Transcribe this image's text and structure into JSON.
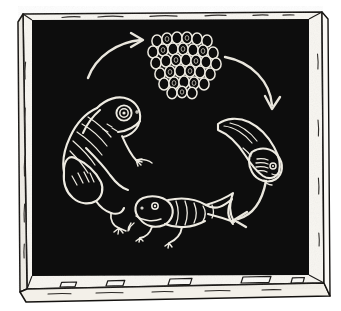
{
  "illustration": {
    "title": "Frog Life Cycle Chalkboard Diagram",
    "medium": "chalk drawing on blackboard",
    "board_color": "#0d0c0b",
    "chalk_color": "#f2f0ea",
    "frame_color": "#f7f5f0",
    "frame_line_color": "#14120f",
    "outer_background": "#ffffff",
    "board_rect": {
      "x": 30,
      "y": 18,
      "width": 278,
      "height": 258
    },
    "frame_outer": {
      "x": 18,
      "y": 8,
      "width": 306,
      "height": 284
    },
    "cycle_direction": "clockwise"
  },
  "stages": [
    {
      "id": "eggs",
      "name": "frog-eggs",
      "label": "Frog eggs (spawn)",
      "order": 1,
      "center": {
        "x": 184,
        "y": 62
      },
      "egg_count": 40,
      "egg_rows": [
        6,
        7,
        7,
        7,
        7,
        4,
        2
      ],
      "description": "Cluster of oval eggs, white chalk outlines with dark centers"
    },
    {
      "id": "tadpole",
      "name": "tadpole",
      "label": "Tadpole",
      "order": 2,
      "center": {
        "x": 254,
        "y": 148
      },
      "description": "Tadpole with external gills, head lower-right, tail sweeping upper-left"
    },
    {
      "id": "froglet",
      "name": "froglet",
      "label": "Froglet (tadpole with legs)",
      "order": 3,
      "center": {
        "x": 174,
        "y": 228
      },
      "description": "Tadpole that has grown hind and front legs, tail still present, facing left"
    },
    {
      "id": "adult-frog",
      "name": "adult-frog",
      "label": "Adult frog",
      "order": 4,
      "center": {
        "x": 92,
        "y": 140
      },
      "description": "Adult frog in profile facing right, large round eye, folded hind leg"
    }
  ],
  "arrows": [
    {
      "id": "arrow-frog-to-eggs",
      "name": "arrow-adult-frog-to-eggs",
      "from": "adult-frog",
      "to": "eggs",
      "direction": "up-right",
      "label": "lays eggs"
    },
    {
      "id": "arrow-eggs-to-tadpole",
      "name": "arrow-eggs-to-tadpole",
      "from": "eggs",
      "to": "tadpole",
      "direction": "down-right",
      "label": "hatch"
    },
    {
      "id": "arrow-tadpole-to-froglet",
      "name": "arrow-tadpole-to-froglet",
      "from": "tadpole",
      "to": "froglet",
      "direction": "down-left",
      "label": "grows legs"
    }
  ],
  "chalk_tray": {
    "name": "chalk-tray",
    "label": "Chalk ledge",
    "pieces": [
      {
        "x": 60,
        "y": 282,
        "width": 16,
        "height": 5
      },
      {
        "x": 107,
        "y": 280,
        "width": 17,
        "height": 6
      },
      {
        "x": 169,
        "y": 279,
        "width": 22,
        "height": 7
      },
      {
        "x": 242,
        "y": 279,
        "width": 28,
        "height": 7
      },
      {
        "x": 292,
        "y": 282,
        "width": 12,
        "height": 6
      }
    ]
  }
}
